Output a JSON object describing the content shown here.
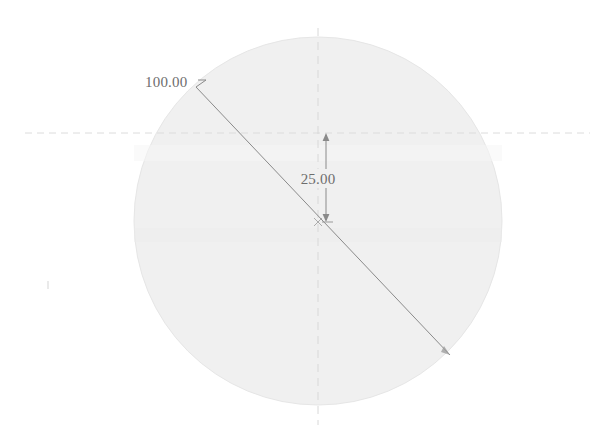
{
  "drawing": {
    "type": "cad-dimensioned-circle",
    "canvas": {
      "width": 607,
      "height": 442,
      "background": "#ffffff"
    },
    "shape": {
      "name": "circle",
      "center_x": 318,
      "center_y": 221,
      "radius": 184,
      "fill_color": "#f0f0f0",
      "stroke_color": "#e6e6e6"
    },
    "dimensions": [
      {
        "id": "diameter",
        "label": "100.00",
        "value": 100.0,
        "kind": "diameter-leader",
        "text_x": 145,
        "text_y": 87,
        "line_start_x": 196,
        "line_start_y": 87,
        "line_end_x": 450,
        "line_end_y": 355,
        "leader_x": 206,
        "leader_y": 80,
        "color": "#8a8a8a"
      },
      {
        "id": "offset",
        "label": "25.00",
        "value": 25.0,
        "kind": "linear-vertical",
        "text_x": 318,
        "text_y": 183,
        "line_x": 326,
        "line_top_y": 133,
        "line_bottom_y": 222,
        "color": "#8a8a8a"
      }
    ],
    "centerlines": [
      {
        "id": "vertical-centerline",
        "orientation": "vertical",
        "x": 318,
        "start": 28,
        "end": 425,
        "color": "#d8d8d8"
      },
      {
        "id": "horizontal-centerline",
        "orientation": "horizontal",
        "y": 133,
        "start": 25,
        "end": 590,
        "color": "#dcdcdc"
      }
    ],
    "marks": [
      {
        "id": "stray-tick",
        "x": 48,
        "y": 285,
        "color": "#d5d5d5"
      }
    ],
    "center_point": {
      "x": 318,
      "y": 222,
      "color": "#9a9a9a"
    }
  }
}
